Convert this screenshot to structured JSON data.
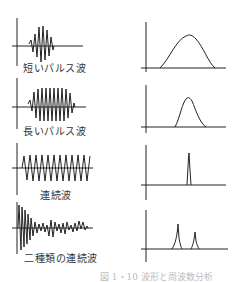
{
  "figure": {
    "caption": "図 1・10 波形と周波数分析",
    "ink_color": "#222222",
    "rows": [
      {
        "id": "short-pulse",
        "label": "短いパルス波",
        "waveform": {
          "type": "short burst"
        },
        "spectrum": {
          "type": "broad peak"
        }
      },
      {
        "id": "long-pulse",
        "label": "長いパルス波",
        "waveform": {
          "type": "long burst"
        },
        "spectrum": {
          "type": "narrow peak"
        }
      },
      {
        "id": "continuous",
        "label": "連続波",
        "waveform": {
          "type": "continuous sinusoid"
        },
        "spectrum": {
          "type": "single line"
        }
      },
      {
        "id": "two-continuous",
        "label": "二種類の連続波",
        "waveform": {
          "type": "decaying plus secondary oscillation"
        },
        "spectrum": {
          "type": "two lines"
        }
      }
    ]
  }
}
